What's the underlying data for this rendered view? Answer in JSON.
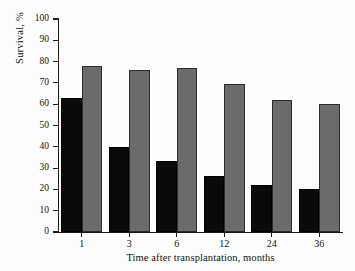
{
  "chart_data": {
    "type": "bar",
    "title": "",
    "xlabel": "Time after transplantation, months",
    "ylabel": "Survival, %",
    "categories": [
      "1",
      "3",
      "6",
      "12",
      "24",
      "36"
    ],
    "series": [
      {
        "name": "black-series",
        "color": "#0a0a0a",
        "values": [
          63,
          40,
          33.5,
          26.5,
          22,
          20
        ]
      },
      {
        "name": "gray-series",
        "color": "#6b6b6b",
        "values": [
          78,
          76,
          77,
          69.5,
          62,
          60
        ]
      }
    ],
    "ylim": [
      0,
      100
    ],
    "ytick_labels": [
      "0",
      "10",
      "20",
      "30",
      "40",
      "50",
      "60",
      "70",
      "80",
      "90",
      "100"
    ],
    "ytick_values": [
      0,
      10,
      20,
      30,
      40,
      50,
      60,
      70,
      80,
      90,
      100
    ],
    "grid": false,
    "legend": false,
    "legend_position": "none"
  },
  "axes": {
    "y_title": "Survival, %",
    "x_title": "Time after transplantation, months"
  },
  "colors": {
    "background": "#fdfdfd",
    "axis": "#1a1a1a",
    "text": "#121212",
    "series_dark": "#0a0a0a",
    "series_light": "#6b6b6b",
    "series_light_border": "#2c2c2c"
  }
}
